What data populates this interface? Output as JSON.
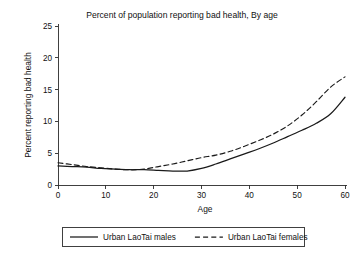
{
  "chart_data": {
    "type": "line",
    "title": "Percent of population reporting bad health, By age",
    "xlabel": "Age",
    "ylabel": "Percent reporting bad health",
    "xlim": [
      0,
      60
    ],
    "ylim": [
      0,
      25
    ],
    "xticks": [
      0,
      10,
      20,
      30,
      40,
      50,
      60
    ],
    "yticks": [
      0,
      5,
      10,
      15,
      20,
      25
    ],
    "grid": false,
    "legend_position": "bottom",
    "x": [
      0,
      3,
      6,
      9,
      12,
      15,
      18,
      21,
      24,
      27,
      30,
      33,
      36,
      39,
      42,
      45,
      48,
      51,
      54,
      57,
      60
    ],
    "series": [
      {
        "name": "Urban LaoTai males",
        "style": "solid",
        "color": "#1a1a1a",
        "values": [
          3.0,
          2.9,
          2.8,
          2.6,
          2.5,
          2.4,
          2.4,
          2.3,
          2.2,
          2.2,
          2.6,
          3.3,
          4.1,
          4.9,
          5.7,
          6.6,
          7.6,
          8.6,
          9.7,
          11.2,
          13.8
        ]
      },
      {
        "name": "Urban LaoTai females",
        "style": "dashed",
        "color": "#1a1a1a",
        "values": [
          3.5,
          3.2,
          2.9,
          2.7,
          2.5,
          2.4,
          2.5,
          2.9,
          3.3,
          3.8,
          4.3,
          4.7,
          5.3,
          6.1,
          7.0,
          8.0,
          9.3,
          11.0,
          13.1,
          15.4,
          17.0
        ]
      }
    ]
  },
  "legend": {
    "entries": [
      {
        "label": "Urban LaoTai males",
        "style": "solid"
      },
      {
        "label": "Urban LaoTai females",
        "style": "dashed"
      }
    ]
  }
}
